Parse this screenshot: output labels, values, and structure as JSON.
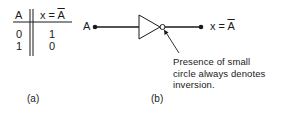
{
  "truth_table": {
    "headers": {
      "input": "A",
      "output_prefix": "x = ",
      "output_var": "A"
    },
    "rows": [
      {
        "a": "0",
        "x": "1"
      },
      {
        "a": "1",
        "x": "0"
      }
    ]
  },
  "inverter": {
    "input_label": "A",
    "output_prefix": "x = ",
    "output_var": "A",
    "annotation": [
      "Presence of small",
      "circle always denotes",
      "inversion."
    ]
  },
  "captions": {
    "a": "(a)",
    "b": "(b)"
  }
}
